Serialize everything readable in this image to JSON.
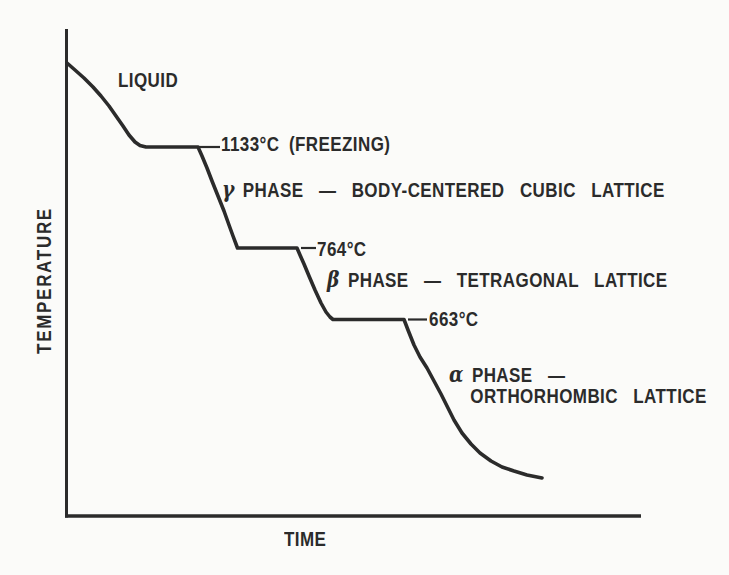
{
  "figure": {
    "ink_color": "#2b2b2b",
    "paper_color": "#fbfbf9",
    "ylabel": "TEMPERATURE",
    "xlabel": "TIME",
    "liquid": "LIQUID",
    "freezing_label": "1133°C (FREEZING)",
    "label_764": "764°C",
    "label_663": "663°C",
    "gamma": {
      "symbol": "γ",
      "text": "PHASE — BODY-CENTERED CUBIC LATTICE"
    },
    "beta": {
      "symbol": "β",
      "text": "PHASE — TETRAGONAL LATTICE"
    },
    "alpha": {
      "symbol": "α",
      "line1": "PHASE —",
      "line2": "ORTHORHOMBIC LATTICE"
    }
  },
  "chart_data": {
    "type": "line",
    "xlabel": "TIME",
    "ylabel": "TEMPERATURE",
    "grid": false,
    "axis_numeric_labels": false,
    "annotations": [
      "LIQUID",
      "1133°C (FREEZING)",
      "γ PHASE — BODY-CENTERED CUBIC LATTICE",
      "764°C",
      "β PHASE — TETRAGONAL LATTICE",
      "663°C",
      "α PHASE — ORTHORHOMBIC LATTICE"
    ],
    "plateau_temperatures_c": [
      1133,
      764,
      663
    ],
    "phases": [
      {
        "symbol": "",
        "lattice": "LIQUID"
      },
      {
        "symbol": "γ",
        "lattice": "BODY-CENTERED CUBIC LATTICE"
      },
      {
        "symbol": "β",
        "lattice": "TETRAGONAL LATTICE"
      },
      {
        "symbol": "α",
        "lattice": "ORTHORHOMBIC LATTICE"
      }
    ],
    "series": [
      {
        "name": "cooling-curve",
        "segments": [
          {
            "label": "liquid-cooling",
            "points_px": [
              [
                67,
                63
              ],
              [
                75,
                70
              ],
              [
                84,
                78
              ],
              [
                93,
                87
              ],
              [
                101,
                96
              ],
              [
                109,
                106
              ],
              [
                116,
                116
              ],
              [
                123,
                126
              ],
              [
                129,
                135
              ],
              [
                135,
                142
              ],
              [
                140,
                145.5
              ],
              [
                146,
                147
              ]
            ]
          },
          {
            "label": "freezing-plateau-1133C",
            "points_px": [
              [
                146,
                147
              ],
              [
                198,
                147
              ]
            ]
          },
          {
            "label": "gamma-cooling",
            "points_px": [
              [
                198,
                147
              ],
              [
                202,
                156
              ],
              [
                207,
                168
              ],
              [
                212,
                181
              ],
              [
                218,
                196
              ],
              [
                224,
                211
              ],
              [
                229,
                225
              ],
              [
                233,
                236
              ],
              [
                236,
                244
              ],
              [
                237.5,
                248
              ]
            ]
          },
          {
            "label": "plateau-764C",
            "points_px": [
              [
                237.5,
                248
              ],
              [
                297,
                248
              ]
            ]
          },
          {
            "label": "beta-cooling",
            "points_px": [
              [
                297,
                248
              ],
              [
                300,
                255
              ],
              [
                304,
                264
              ],
              [
                309,
                276
              ],
              [
                315,
                290
              ],
              [
                321,
                303
              ],
              [
                326,
                312
              ],
              [
                330,
                317
              ],
              [
                333,
                319.5
              ]
            ]
          },
          {
            "label": "plateau-663C",
            "points_px": [
              [
                333,
                319.5
              ],
              [
                404,
                319.5
              ]
            ]
          },
          {
            "label": "alpha-cooling",
            "points_px": [
              [
                404,
                319.5
              ],
              [
                408,
                330
              ],
              [
                414,
                345
              ],
              [
                420,
                357
              ],
              [
                427,
                368
              ],
              [
                434,
                381
              ],
              [
                441,
                394
              ],
              [
                448,
                408
              ],
              [
                454,
                420
              ],
              [
                462,
                433
              ],
              [
                471,
                444
              ],
              [
                480,
                453
              ],
              [
                491,
                461
              ],
              [
                502,
                467
              ],
              [
                514,
                471
              ],
              [
                527,
                475
              ],
              [
                542,
                478
              ]
            ]
          }
        ]
      }
    ],
    "leader_lines_px": [
      [
        198,
        147,
        220,
        147
      ],
      [
        301,
        248,
        316,
        248
      ],
      [
        408,
        319.5,
        427,
        319.5
      ]
    ]
  }
}
